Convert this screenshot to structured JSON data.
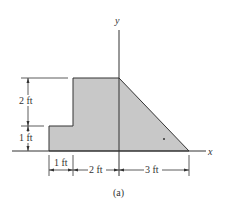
{
  "figure": {
    "caption": "(a)",
    "axes": {
      "x_label": "x",
      "y_label": "y"
    },
    "shape": {
      "fill": "#c8c8c8",
      "stroke": "#333333",
      "description": "composite area: 1 ft x 1 ft step, 2 ft x 3 ft rectangle, 3 ft x 3 ft right triangle",
      "vertices_ft": [
        [
          -3,
          0
        ],
        [
          -3,
          1
        ],
        [
          -2,
          1
        ],
        [
          -2,
          3
        ],
        [
          0,
          3
        ],
        [
          3,
          0
        ]
      ]
    },
    "dimensions": {
      "vertical": [
        {
          "label": "2 ft",
          "value_ft": 2
        },
        {
          "label": "1 ft",
          "value_ft": 1
        }
      ],
      "horizontal": [
        {
          "label": "1 ft",
          "value_ft": 1
        },
        {
          "label": "2 ft",
          "value_ft": 2
        },
        {
          "label": "3 ft",
          "value_ft": 3
        }
      ]
    }
  }
}
